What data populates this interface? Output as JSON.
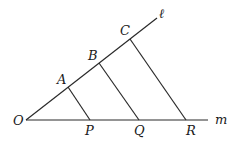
{
  "diagram": {
    "points": {
      "O": {
        "label": "O",
        "x": 26,
        "y": 120
      },
      "A": {
        "label": "A",
        "x": 68,
        "y": 87
      },
      "B": {
        "label": "B",
        "x": 99,
        "y": 63
      },
      "C": {
        "label": "C",
        "x": 130,
        "y": 39
      },
      "P": {
        "label": "P",
        "x": 90,
        "y": 120
      },
      "Q": {
        "label": "Q",
        "x": 139,
        "y": 120
      },
      "R": {
        "label": "R",
        "x": 186,
        "y": 120
      }
    },
    "lines": {
      "l": {
        "label": "ℓ",
        "from": "O",
        "to_end": {
          "x": 157,
          "y": 18
        }
      },
      "m": {
        "label": "m",
        "from": "O",
        "to_end": {
          "x": 208,
          "y": 120
        }
      }
    },
    "segments": [
      {
        "from": "A",
        "to": "P"
      },
      {
        "from": "B",
        "to": "Q"
      },
      {
        "from": "C",
        "to": "R"
      }
    ]
  }
}
